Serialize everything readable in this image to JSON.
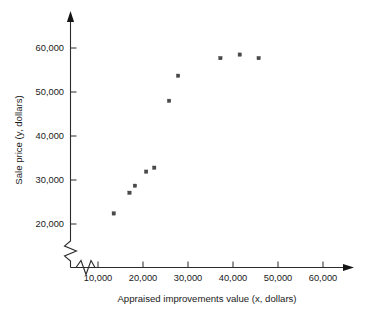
{
  "chart_data": {
    "type": "scatter",
    "title": "",
    "xlabel": "Appraised improvements value (x, dollars)",
    "ylabel": "Sale price (y, dollars)",
    "xlim": [
      5000,
      64000
    ],
    "ylim": [
      16000,
      64000
    ],
    "grid": false,
    "legend": null,
    "axis_break": {
      "x_axis": true,
      "y_axis": true,
      "note": "zigzag break marks near the origin on both axes"
    },
    "xticks": [
      10000,
      20000,
      30000,
      40000,
      50000,
      60000
    ],
    "xtick_labels": [
      "10,000",
      "20,000",
      "30,000",
      "40,000",
      "50,000",
      "60,000"
    ],
    "yticks": [
      20000,
      30000,
      40000,
      50000,
      60000
    ],
    "ytick_labels": [
      "20,000",
      "30,000",
      "40,000",
      "50,000",
      "60,000"
    ],
    "series": [
      {
        "name": "Sale price vs appraised improvements value",
        "marker": "square",
        "color": "#4a4a4a",
        "points": [
          {
            "x": 13500,
            "y": 22400
          },
          {
            "x": 17000,
            "y": 27100
          },
          {
            "x": 18200,
            "y": 28700
          },
          {
            "x": 20700,
            "y": 31900
          },
          {
            "x": 22500,
            "y": 32800
          },
          {
            "x": 25800,
            "y": 48000
          },
          {
            "x": 27800,
            "y": 53700
          },
          {
            "x": 37200,
            "y": 57700
          },
          {
            "x": 41500,
            "y": 58500
          },
          {
            "x": 45700,
            "y": 57700
          }
        ]
      }
    ]
  }
}
